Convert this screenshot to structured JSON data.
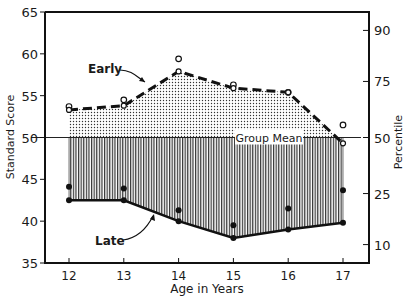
{
  "chart_data": {
    "type": "line",
    "title": "",
    "xlabel": "Age in Years",
    "ylabel": "Standard Score",
    "y2label": "Percentile",
    "x": [
      12,
      13,
      14,
      15,
      16,
      17
    ],
    "ylim": [
      35,
      65
    ],
    "yticks": [
      35,
      40,
      45,
      50,
      55,
      60,
      65
    ],
    "y2ticks": [
      {
        "label": "10",
        "score": 37.2
      },
      {
        "label": "25",
        "score": 43.3
      },
      {
        "label": "50",
        "score": 50
      },
      {
        "label": "75",
        "score": 56.7
      },
      {
        "label": "90",
        "score": 62.8
      }
    ],
    "reference_line": {
      "label": "Group Mean",
      "value": 50
    },
    "series": [
      {
        "name": "Early",
        "style": "dashed",
        "fill": "dotted",
        "values": [
          53.3,
          53.8,
          57.9,
          55.9,
          55.4,
          49.3
        ]
      },
      {
        "name": "Early (individual points)",
        "marker": "open-circle",
        "values": [
          53.7,
          54.5,
          59.4,
          56.3,
          55.4,
          51.5
        ]
      },
      {
        "name": "Late",
        "style": "solid",
        "fill": "vertical-hatch",
        "values": [
          42.5,
          42.5,
          40.0,
          38.0,
          39.0,
          39.8
        ]
      },
      {
        "name": "Late (individual points)",
        "marker": "filled-circle",
        "values": [
          44.1,
          43.9,
          41.3,
          39.5,
          41.5,
          43.7
        ]
      }
    ],
    "annotations": [
      {
        "text": "Early",
        "points_to": "Early line near age 13.5"
      },
      {
        "text": "Late",
        "points_to": "Late line near age 13.5"
      },
      {
        "text": "Group Mean",
        "at": 50
      }
    ],
    "grid": false,
    "legend": "none"
  }
}
